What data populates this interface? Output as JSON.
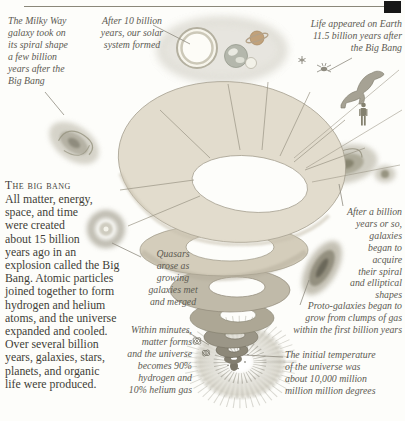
{
  "page": {
    "background": "#fdfdfa",
    "rule_color": "#8a8779",
    "corner_marker_color": "#171717"
  },
  "section": {
    "heading": "The big bang",
    "body_lines": [
      "All matter, energy,",
      "space, and time",
      "were created",
      "about 15 billion",
      "years ago in an",
      "explosion called the Big",
      "Bang. Atomic particles",
      "joined together to form",
      "hydrogen and helium",
      "atoms, and the universe",
      "expanded and cooled.",
      "Over several billion",
      "years, galaxies, stars,",
      "planets, and organic",
      "life were produced."
    ]
  },
  "annotations": {
    "milky_way": {
      "lines": [
        "The Milky Way",
        "galaxy took on",
        "its spiral shape",
        "a few billion",
        "years after the",
        "Big Bang"
      ]
    },
    "solar_system": {
      "lines": [
        "After 10 billion",
        "years, our solar",
        "system formed"
      ]
    },
    "life_on_earth": {
      "lines": [
        "Life appeared on Earth",
        "11.5 billion years after",
        "the Big Bang"
      ]
    },
    "quasars": {
      "lines": [
        "Quasars",
        "arose as",
        "growing",
        "galaxies met",
        "and merged"
      ]
    },
    "galaxy_shapes": {
      "lines": [
        "After a billion",
        "years or so,",
        "galaxies",
        "began to",
        "acquire",
        "their spiral",
        "and elliptical",
        "shapes"
      ]
    },
    "proto_galaxies": {
      "lines": [
        "Proto-galaxies began to",
        "grow from clumps of gas",
        "within the first billion years"
      ]
    },
    "matter_forms": {
      "lines": [
        "Within minutes,",
        "matter forms",
        "and the universe",
        "becomes 90%",
        "hydrogen and",
        "10% helium gas"
      ]
    },
    "initial_temperature": {
      "lines": [
        "The initial temperature",
        "of the universe was",
        "about 10,000 million",
        "million million degrees"
      ]
    }
  },
  "artwork": {
    "colors": {
      "cone_top": "#e2dccd",
      "cone_mid": "#d4cdbb",
      "cone_dark": "#8d8879",
      "burst_gray": "#97948a",
      "galaxy_gray": "#b5b2a6",
      "annotation_text": "#5c5a52",
      "body_text": "#3f3d37"
    }
  },
  "icons": {
    "corner_marker": "corner-marker-icon",
    "life_icons": [
      "flower-icon",
      "insect-icon",
      "dinosaur-icon",
      "human-icon"
    ]
  }
}
